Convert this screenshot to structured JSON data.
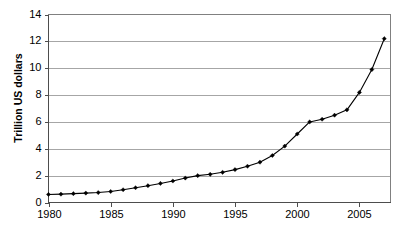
{
  "chart_data": {
    "type": "line",
    "title": "",
    "xlabel": "",
    "ylabel": "Trillion US dollars",
    "xlim": [
      1980,
      2007.5
    ],
    "ylim": [
      0,
      14
    ],
    "ytick_step": 2,
    "xtick_step": 5,
    "grid": true,
    "legend": "none",
    "marker": "diamond",
    "line_color": "#000000",
    "grid_color": "#a6a6a6",
    "border_color": "#808080",
    "yticks": [
      "0",
      "2",
      "4",
      "6",
      "8",
      "10",
      "12",
      "14"
    ],
    "xticks": [
      "1980",
      "1985",
      "1990",
      "1995",
      "2000",
      "2005"
    ],
    "x": [
      1980,
      1981,
      1982,
      1983,
      1984,
      1985,
      1986,
      1987,
      1988,
      1989,
      1990,
      1991,
      1992,
      1993,
      1994,
      1995,
      1996,
      1997,
      1998,
      1999,
      2000,
      2001,
      2002,
      2003,
      2004,
      2005,
      2006,
      2007
    ],
    "values": [
      0.6,
      0.62,
      0.66,
      0.7,
      0.74,
      0.82,
      0.95,
      1.1,
      1.25,
      1.42,
      1.6,
      1.82,
      2.0,
      2.1,
      2.25,
      2.45,
      2.7,
      3.0,
      3.5,
      4.2,
      5.1,
      6.0,
      6.2,
      6.5,
      6.9,
      8.2,
      9.9,
      12.2
    ],
    "series_name": "Trillion US dollars"
  }
}
